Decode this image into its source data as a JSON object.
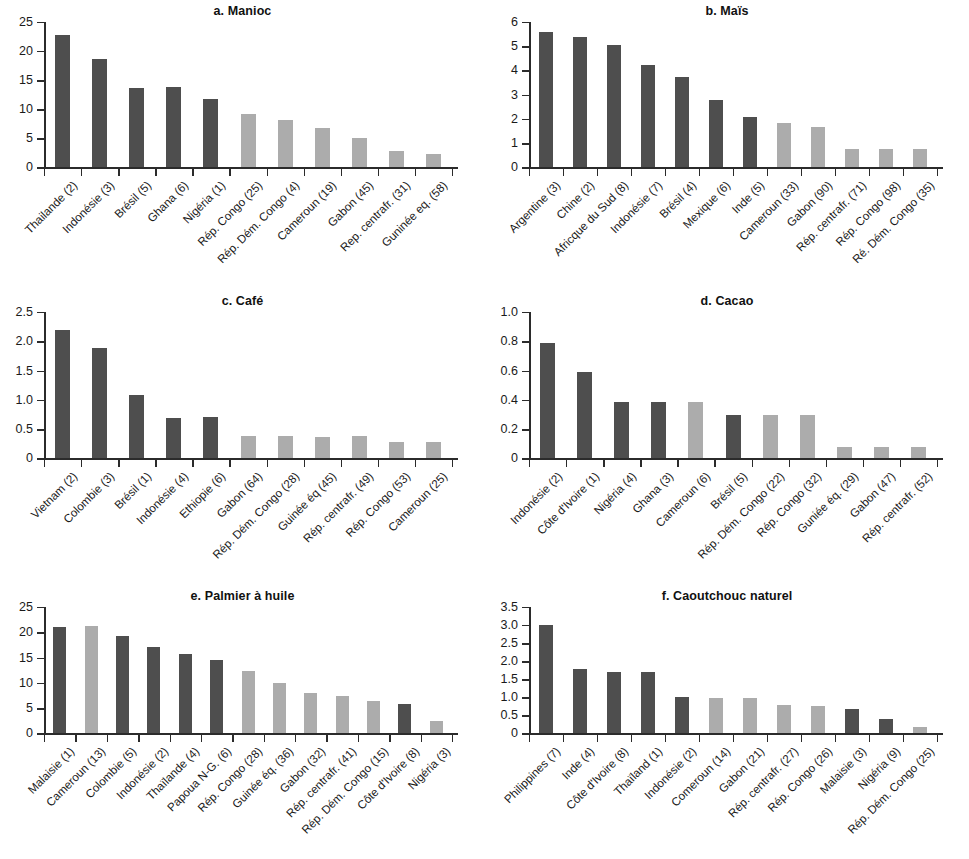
{
  "figure": {
    "background": "#ffffff",
    "bar_color_dark": "#4e4e4e",
    "bar_color_light": "#acacac",
    "axis_color": "#2b2b2b"
  },
  "chart_data": [
    {
      "id": "a",
      "type": "bar",
      "title": "a. Manioc",
      "xlabel": "",
      "ylabel": "",
      "ylim": [
        0,
        25
      ],
      "yticks": [
        0,
        5,
        10,
        15,
        20,
        25
      ],
      "ytick_labels": [
        "0",
        "5",
        "10",
        "15",
        "20",
        "25"
      ],
      "grid": false,
      "legend": "none",
      "categories": [
        "Thailande (2)",
        "Indonésie (3)",
        "Brésil (5)",
        "Ghana (6)",
        "Nigéria (1)",
        "Rép. Congo (25)",
        "Rép. Dém. Congo (4)",
        "Cameroun (19)",
        "Gabon (45)",
        "Rep. centrafr. (31)",
        "Guninée eq. (58)"
      ],
      "values": [
        22.8,
        18.7,
        13.7,
        13.8,
        11.8,
        9.1,
        8.1,
        6.7,
        5.0,
        2.9,
        2.3
      ],
      "colors": [
        "dark",
        "dark",
        "dark",
        "dark",
        "dark",
        "light",
        "light",
        "light",
        "light",
        "light",
        "light"
      ]
    },
    {
      "id": "b",
      "type": "bar",
      "title": "b. Maïs",
      "xlabel": "",
      "ylabel": "",
      "ylim": [
        0,
        6
      ],
      "yticks": [
        0,
        1,
        2,
        3,
        4,
        5,
        6
      ],
      "ytick_labels": [
        "0",
        "1",
        "2",
        "3",
        "4",
        "5",
        "6"
      ],
      "grid": false,
      "legend": "none",
      "categories": [
        "Argentine (3)",
        "Chine (2)",
        "Africque du Sud (8)",
        "Indonésie (7)",
        "Brésil (4)",
        "Mexique (6)",
        "Inde (5)",
        "Cameroun (33)",
        "Gabon (90)",
        "Rép. centrafr. (71)",
        "Rép. Congo (98)",
        "Ré. Dém. Congo (35)"
      ],
      "values": [
        5.6,
        5.37,
        5.05,
        4.22,
        3.72,
        2.79,
        2.08,
        1.85,
        1.65,
        0.78,
        0.78,
        0.78
      ],
      "colors": [
        "dark",
        "dark",
        "dark",
        "dark",
        "dark",
        "dark",
        "dark",
        "light",
        "light",
        "light",
        "light",
        "light"
      ]
    },
    {
      "id": "c",
      "type": "bar",
      "title": "c. Café",
      "xlabel": "",
      "ylabel": "",
      "ylim": [
        0,
        2.5
      ],
      "yticks": [
        0,
        0.5,
        1.0,
        1.5,
        2.0,
        2.5
      ],
      "ytick_labels": [
        "0",
        "0.5",
        "1.0",
        "1.5",
        "2.0",
        "2.5"
      ],
      "grid": false,
      "legend": "none",
      "categories": [
        "Vietnam (2)",
        "Colombie (3)",
        "Brésil (1)",
        "Indonésie (4)",
        "Ethiopie (6)",
        "Gabon (64)",
        "Rép. Dém. Congo (28)",
        "Guinée éq (45)",
        "Rép. centrafr. (49)",
        "Rép. Congo (53)",
        "Cameroun (25)"
      ],
      "values": [
        2.2,
        1.89,
        1.08,
        0.69,
        0.7,
        0.38,
        0.38,
        0.37,
        0.38,
        0.28,
        0.28
      ],
      "colors": [
        "dark",
        "dark",
        "dark",
        "dark",
        "dark",
        "light",
        "light",
        "light",
        "light",
        "light",
        "light"
      ]
    },
    {
      "id": "d",
      "type": "bar",
      "title": "d. Cacao",
      "xlabel": "",
      "ylabel": "",
      "ylim": [
        0,
        1.0
      ],
      "yticks": [
        0,
        0.2,
        0.4,
        0.6,
        0.8,
        1.0
      ],
      "ytick_labels": [
        "0",
        "0.2",
        "0.4",
        "0.6",
        "0.8",
        "1.0"
      ],
      "grid": false,
      "legend": "none",
      "categories": [
        "Indonésie (2)",
        "Côte d'Ivoire (1)",
        "Nigéria (4)",
        "Ghana (3)",
        "Cameroun (6)",
        "Brésil (5)",
        "Rép. Dém. Congo (22)",
        "Rép. Congo (32)",
        "Guniée éq. (29)",
        "Gabon (47)",
        "Rép. centrafr. (52)"
      ],
      "values": [
        0.79,
        0.59,
        0.385,
        0.385,
        0.385,
        0.295,
        0.295,
        0.295,
        0.08,
        0.08,
        0.08
      ],
      "colors": [
        "dark",
        "dark",
        "dark",
        "dark",
        "light",
        "dark",
        "light",
        "light",
        "light",
        "light",
        "light"
      ]
    },
    {
      "id": "e",
      "type": "bar",
      "title": "e. Palmier à huile",
      "xlabel": "",
      "ylabel": "",
      "ylim": [
        0,
        25
      ],
      "yticks": [
        0,
        5,
        10,
        15,
        20,
        25
      ],
      "ytick_labels": [
        "0",
        "5",
        "10",
        "15",
        "20",
        "25"
      ],
      "grid": false,
      "legend": "none",
      "categories": [
        "Malaisie (1)",
        "Cameroun (13)",
        "Colombie (5)",
        "Indonésie (2)",
        "Thaïlande (4)",
        "Papoua N-G. (6)",
        "Rép. Congo (28)",
        "Guinée éq. (36)",
        "Gabon (32)",
        "Rép. centrafr. (41)",
        "Rép. Dém. Congo (15)",
        "Côte d'Ivoire (8)",
        "Nigéria (3)"
      ],
      "values": [
        21.0,
        21.3,
        19.3,
        17.1,
        15.8,
        14.5,
        12.4,
        9.9,
        7.9,
        7.4,
        6.5,
        5.8,
        2.4
      ],
      "colors": [
        "dark",
        "light",
        "dark",
        "dark",
        "dark",
        "dark",
        "light",
        "light",
        "light",
        "light",
        "light",
        "dark",
        "light"
      ]
    },
    {
      "id": "f",
      "type": "bar",
      "title": "f. Caoutchouc naturel",
      "xlabel": "",
      "ylabel": "",
      "ylim": [
        0,
        3.5
      ],
      "yticks": [
        0,
        0.5,
        1.0,
        1.5,
        2.0,
        2.5,
        3.0,
        3.5
      ],
      "ytick_labels": [
        "0",
        "0.5",
        "1.0",
        "1.5",
        "2.0",
        "2.5",
        "3.0",
        "3.5"
      ],
      "grid": false,
      "legend": "none",
      "categories": [
        "Philippines (7)",
        "Inde (4)",
        "Côte d'Ivoire (8)",
        "Thaïland (1)",
        "Indonésie (2)",
        "Comeroun (14)",
        "Gabon (21)",
        "Rép. centrafr. (27)",
        "Rép. Congo (26)",
        "Malaisie (3)",
        "Nigéria (9)",
        "Rép. Dém. Congo (25)"
      ],
      "values": [
        3.0,
        1.78,
        1.69,
        1.69,
        1.0,
        0.98,
        0.98,
        0.78,
        0.77,
        0.68,
        0.39,
        0.17
      ],
      "colors": [
        "dark",
        "dark",
        "dark",
        "dark",
        "dark",
        "light",
        "light",
        "light",
        "light",
        "dark",
        "dark",
        "light"
      ]
    }
  ]
}
